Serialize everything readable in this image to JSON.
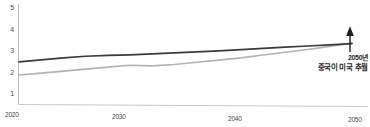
{
  "chart_data": {
    "type": "line",
    "title": "",
    "subtitle": "",
    "xlabel": "",
    "ylabel": "",
    "xlim": [
      2020,
      2050
    ],
    "ylim": [
      0,
      5
    ],
    "grid": false,
    "legend_position": "none",
    "y_ticks": [
      "1",
      "2",
      "3",
      "4",
      "5"
    ],
    "y_tick_values": [
      1,
      2,
      3,
      4,
      5
    ],
    "x_ticks": [
      "2020",
      "2030",
      "2040",
      "2050"
    ],
    "x_tick_values": [
      2020,
      2030,
      2040,
      2050
    ],
    "x": [
      2020,
      2022,
      2024,
      2026,
      2028,
      2030,
      2032,
      2034,
      2036,
      2038,
      2040,
      2042,
      2044,
      2046,
      2048,
      2050
    ],
    "series": [
      {
        "name": "united-states",
        "color": "#3b3b3b",
        "values": [
          2.12,
          2.22,
          2.32,
          2.4,
          2.44,
          2.47,
          2.52,
          2.57,
          2.62,
          2.67,
          2.73,
          2.79,
          2.85,
          2.91,
          2.97,
          3.03
        ]
      },
      {
        "name": "china",
        "color": "#b3b3b3",
        "values": [
          1.47,
          1.56,
          1.66,
          1.76,
          1.86,
          1.95,
          1.92,
          1.99,
          2.1,
          2.21,
          2.32,
          2.46,
          2.6,
          2.74,
          2.89,
          3.06
        ]
      }
    ],
    "annotations": [
      {
        "name": "crossover-callout",
        "line1": "2050년",
        "line2": "중국이 미국 추월",
        "arrow": "up-arrow",
        "at_x": 2050,
        "at_y": 3.05
      }
    ]
  }
}
